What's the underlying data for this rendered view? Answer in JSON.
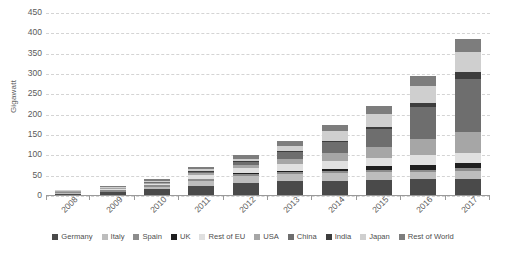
{
  "chart_data": {
    "type": "bar",
    "stacked": true,
    "title": "",
    "xlabel": "",
    "ylabel": "Gigawatt",
    "ylim": [
      0,
      450
    ],
    "ytick_step": 50,
    "yticks": [
      450,
      400,
      350,
      300,
      250,
      200,
      150,
      100,
      50,
      0
    ],
    "grid": true,
    "legend_position": "bottom",
    "categories": [
      "2008",
      "2009",
      "2010",
      "2011",
      "2012",
      "2013",
      "2014",
      "2015",
      "2016",
      "2017"
    ],
    "series": [
      {
        "name": "Germany",
        "color": "#4a4a4a",
        "values": [
          6,
          10,
          18,
          25,
          33,
          36,
          38,
          40,
          41,
          42
        ]
      },
      {
        "name": "Italy",
        "color": "#bdbdbd",
        "values": [
          0.5,
          1,
          4,
          13,
          16,
          18,
          19,
          19,
          19,
          20
        ]
      },
      {
        "name": "Spain",
        "color": "#8c8c8c",
        "values": [
          3.5,
          3.5,
          4,
          4,
          5,
          5,
          5,
          5,
          5,
          6
        ]
      },
      {
        "name": "UK",
        "color": "#1f1f1f",
        "values": [
          0,
          0,
          0,
          1,
          2,
          3,
          5,
          9,
          12,
          13
        ]
      },
      {
        "name": "Rest of EU",
        "color": "#e0e0e0",
        "values": [
          1,
          2,
          4,
          9,
          13,
          16,
          19,
          21,
          23,
          25
        ]
      },
      {
        "name": "USA",
        "color": "#a6a6a6",
        "values": [
          1,
          2,
          3,
          5,
          8,
          12,
          19,
          26,
          41,
          51
        ]
      },
      {
        "name": "China",
        "color": "#6e6e6e",
        "values": [
          0.1,
          0.3,
          1,
          3,
          7,
          18,
          28,
          44,
          78,
          131
        ]
      },
      {
        "name": "India",
        "color": "#3d3d3d",
        "values": [
          0,
          0,
          0,
          1,
          1,
          2,
          3,
          5,
          9,
          18
        ]
      },
      {
        "name": "Japan",
        "color": "#cfcfcf",
        "values": [
          2,
          3,
          4,
          5,
          7,
          14,
          23,
          34,
          42,
          49
        ]
      },
      {
        "name": "Rest of World",
        "color": "#7d7d7d",
        "values": [
          1,
          2,
          3,
          5,
          8,
          11,
          15,
          19,
          25,
          32
        ]
      }
    ],
    "totals": [
      15,
      24,
      41,
      71,
      100,
      135,
      174,
      222,
      295,
      387
    ]
  },
  "legend": {
    "items": [
      {
        "label": "Germany"
      },
      {
        "label": "Italy"
      },
      {
        "label": "Spain"
      },
      {
        "label": "UK"
      },
      {
        "label": "Rest of EU"
      },
      {
        "label": "USA"
      },
      {
        "label": "China"
      },
      {
        "label": "India"
      },
      {
        "label": "Japan"
      },
      {
        "label": "Rest of World"
      }
    ]
  }
}
